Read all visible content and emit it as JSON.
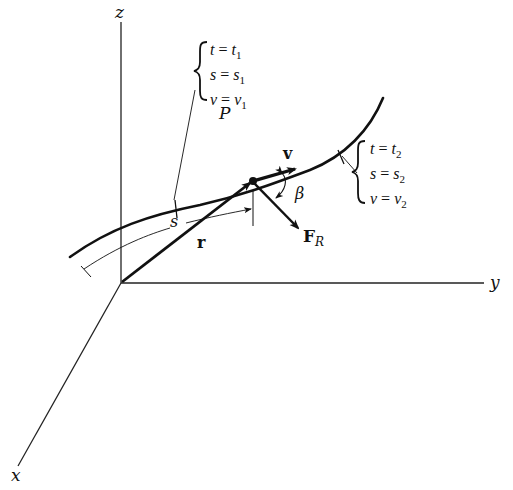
{
  "figure": {
    "axes": {
      "z_label": "z",
      "y_label": "y",
      "x_label": "x"
    },
    "point_label": "P",
    "vectors": {
      "position": "r",
      "velocity": "v",
      "force_main": "F",
      "force_sub": "R"
    },
    "angle_label": "β",
    "arc_length_label": "s",
    "condition_1": {
      "t": {
        "var": "t",
        "eq": " = ",
        "val": "t",
        "sub": "1"
      },
      "s": {
        "var": "s",
        "eq": " = ",
        "val": "s",
        "sub": "1"
      },
      "v": {
        "var": "v",
        "eq": " = ",
        "val": "v",
        "sub": "1"
      }
    },
    "condition_2": {
      "t": {
        "var": "t",
        "eq": " = ",
        "val": "t",
        "sub": "2"
      },
      "s": {
        "var": "s",
        "eq": " = ",
        "val": "s",
        "sub": "2"
      },
      "v": {
        "var": "v",
        "eq": " = ",
        "val": "v",
        "sub": "2"
      }
    },
    "colors": {
      "ink": "#111111",
      "background": "#ffffff"
    }
  }
}
